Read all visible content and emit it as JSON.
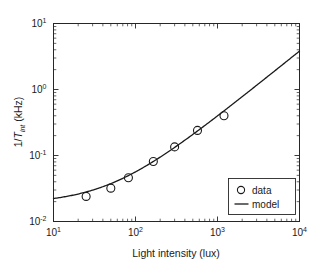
{
  "chart_data": {
    "type": "scatter",
    "title": "",
    "xlabel": "Light intensity (lux)",
    "ylabel_parts": {
      "pre": "1/",
      "italic": "T",
      "sub": "int",
      "post": " (kHz)"
    },
    "ylabel": "1/T_int (kHz)",
    "xscale": "log",
    "yscale": "log",
    "xlim": [
      10,
      10000
    ],
    "ylim": [
      0.01,
      10
    ],
    "grid": false,
    "xticks": [
      10,
      100,
      1000,
      10000
    ],
    "xticklabels": [
      "10",
      "10",
      "10",
      "10"
    ],
    "xtickexps": [
      "1",
      "2",
      "3",
      "4"
    ],
    "yticks": [
      0.01,
      0.1,
      1,
      10
    ],
    "yticklabels": [
      "10",
      "10",
      "10",
      "10"
    ],
    "ytickexps": [
      "-2",
      "-1",
      "0",
      "1"
    ],
    "legend_position": "lower right",
    "series": [
      {
        "name": "data",
        "marker": "circle-open",
        "x": [
          25,
          50,
          82,
          165,
          300,
          570,
          1200
        ],
        "y": [
          0.024,
          0.032,
          0.046,
          0.081,
          0.135,
          0.24,
          0.4
        ]
      },
      {
        "name": "model",
        "marker": "line",
        "formula": "1/T = a + b*I",
        "a": 0.0185,
        "b": 0.00038,
        "x": [
          10,
          16,
          25,
          40,
          63,
          100,
          160,
          250,
          400,
          630,
          1000,
          1600,
          2500,
          4000,
          6300,
          10000
        ],
        "y": [
          0.0189,
          0.0191,
          0.0194,
          0.02,
          0.0209,
          0.0223,
          0.0246,
          0.028,
          0.0337,
          0.0424,
          0.0565,
          0.0793,
          0.1135,
          0.1705,
          0.2579,
          0.3985
        ]
      }
    ]
  },
  "legend": {
    "entries": [
      {
        "label": "data",
        "type": "marker"
      },
      {
        "label": "model",
        "type": "line"
      }
    ]
  },
  "axes": {
    "x_title": "Light intensity (lux)",
    "y_title": "1/T_int (kHz)"
  }
}
